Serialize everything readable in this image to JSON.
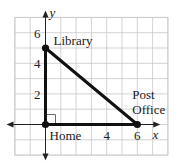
{
  "diagram": {
    "type": "coordinate-plane-triangle",
    "axes": {
      "x_label": "x",
      "y_label": "y",
      "x_range": [
        -2,
        8
      ],
      "y_range": [
        -2,
        7
      ],
      "x_ticks": [
        {
          "value": 4,
          "label": "4"
        },
        {
          "value": 6,
          "label": "6"
        }
      ],
      "y_ticks": [
        {
          "value": 2,
          "label": "2"
        },
        {
          "value": 4,
          "label": "4"
        },
        {
          "value": 6,
          "label": "6"
        }
      ]
    },
    "points": [
      {
        "id": "home",
        "label": "Home",
        "x": 0,
        "y": 0
      },
      {
        "id": "library",
        "label": "Library",
        "x": 0,
        "y": 5
      },
      {
        "id": "post-office",
        "label_line1": "Post",
        "label_line2": "Office",
        "x": 6,
        "y": 0
      }
    ],
    "segments": [
      {
        "from": "home",
        "to": "library"
      },
      {
        "from": "library",
        "to": "post-office"
      },
      {
        "from": "home",
        "to": "post-office"
      }
    ],
    "right_angle_at": "home",
    "colors": {
      "grid": "#c8c8c8",
      "segment": "#111111",
      "text": "#222222"
    }
  }
}
